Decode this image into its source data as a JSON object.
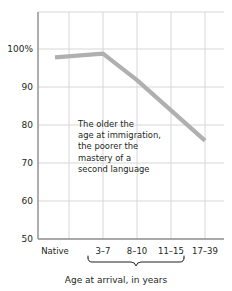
{
  "chart_data": {
    "type": "line",
    "title": "",
    "xlabel": "Age at arrival, in years",
    "ylabel": "",
    "categories": [
      "Native",
      "3–7",
      "8–10",
      "11–15",
      "17–39"
    ],
    "values": [
      98,
      99,
      92,
      84,
      76
    ],
    "ylim": [
      50,
      110
    ],
    "yticks": [
      50,
      60,
      70,
      80,
      90,
      100,
      110
    ],
    "ytick_labels": [
      "50",
      "60",
      "70",
      "80",
      "90",
      "100%",
      ""
    ],
    "grid": true,
    "legend": null,
    "series": [
      {
        "name": "Mastery of second language",
        "values": [
          98,
          99,
          92,
          84,
          76
        ],
        "color": "#b0b0b0"
      }
    ],
    "annotations": [
      {
        "text": "The older the age at immigration, the poorer the mastery of a second language",
        "lines": [
          "The older the",
          "age at immigration,",
          "the poorer the",
          "mastery of a",
          "second language"
        ]
      }
    ],
    "brace": {
      "label": "Age at arrival, in years",
      "covers": [
        "3–7",
        "8–10",
        "11–15",
        "17–39"
      ]
    }
  },
  "colors": {
    "line": "#b0b0b0",
    "grid": "#d6d6d6",
    "axis": "#8c8c8c",
    "text": "#231f20",
    "background": "#ffffff"
  }
}
